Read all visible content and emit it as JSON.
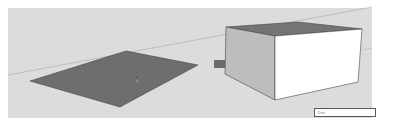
{
  "scene": {
    "description": "SketchUp push/pull illustration: flat face extruded into a box",
    "background_color": "#dcdcdc",
    "face_color": "#6e6e6e",
    "box_front_color": "#ffffff",
    "box_side_color": "#bdbdbd",
    "box_top_color": "#747474",
    "arrow_color": "#6b6b6b",
    "icons": {
      "arrow": "arrow-right-icon",
      "cursor_flat": "push-pull-cursor-icon",
      "cursor_box": "push-pull-cursor-icon"
    }
  },
  "measurements_box": {
    "label": "",
    "value": "Dist"
  }
}
